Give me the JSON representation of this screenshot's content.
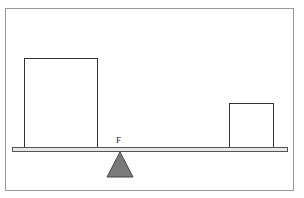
{
  "diagram": {
    "fulcrum_label": "F",
    "colors": {
      "fulcrum": "#7a7a7a",
      "outline": "#333333",
      "beam_fill": "#e8e8e8"
    },
    "objects": [
      {
        "name": "large-block",
        "position": "left"
      },
      {
        "name": "small-block",
        "position": "right"
      }
    ]
  }
}
